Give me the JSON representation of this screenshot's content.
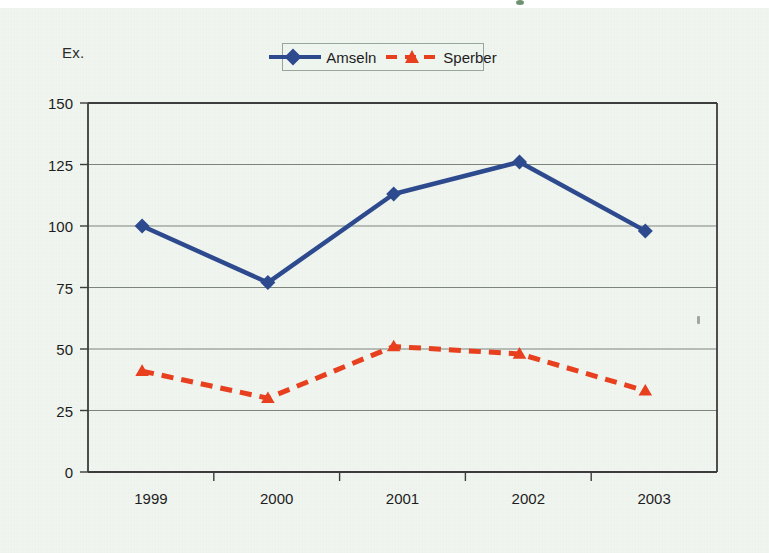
{
  "unit_label": "Ex.",
  "legend": {
    "position": "top-center",
    "entries": [
      {
        "label": "Amseln",
        "color": "#2e4a8e",
        "style": "solid",
        "marker": "diamond"
      },
      {
        "label": "Sperber",
        "color": "#e8401f",
        "style": "dashed",
        "marker": "triangle"
      }
    ]
  },
  "chart_data": {
    "type": "line",
    "title": "",
    "subtitle": "",
    "xlabel": "",
    "ylabel": "Ex.",
    "categories": [
      "1999",
      "2000",
      "2001",
      "2002",
      "2003"
    ],
    "ylim": [
      0,
      150
    ],
    "yticks": [
      0,
      25,
      50,
      75,
      100,
      125,
      150
    ],
    "ytick_labels": [
      "0",
      "25",
      "50",
      "75",
      "100",
      "125",
      "150"
    ],
    "grid": "horizontal",
    "legend_position": "top-center",
    "series": [
      {
        "name": "Amseln",
        "color": "#2e4a8e",
        "line_style": "solid",
        "marker": "diamond",
        "values": [
          100,
          77,
          113,
          126,
          98
        ]
      },
      {
        "name": "Sperber",
        "color": "#e8401f",
        "line_style": "dashed",
        "marker": "triangle",
        "values": [
          41,
          30,
          51,
          48,
          33
        ]
      }
    ]
  }
}
